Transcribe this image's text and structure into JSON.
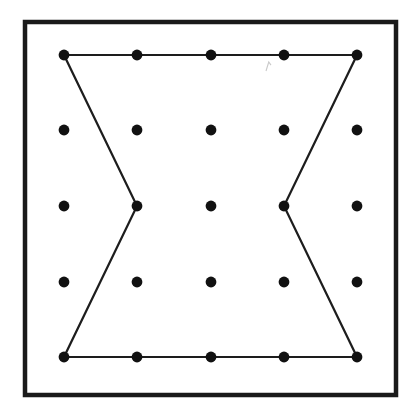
{
  "figure": {
    "canvas": {
      "width": 409,
      "height": 410
    },
    "colors": {
      "background": "#ffffff",
      "ink": "#141414",
      "peg_fill": "#111111",
      "frame_stroke": "#1a1a1a",
      "band_stroke": "#1d1d1d",
      "smudge": "#c9c9c9"
    },
    "frame": {
      "name": "board-frame",
      "x": 25,
      "y": 22,
      "width": 371,
      "height": 373,
      "stroke_width": 4.5
    },
    "grid": {
      "rows": 5,
      "cols": 5,
      "peg_radius": 5.4,
      "col_x": [
        64,
        137,
        211,
        284,
        357
      ],
      "row_y": [
        55,
        130,
        206,
        282,
        357
      ],
      "peg_count": 25
    },
    "band": {
      "name": "hourglass-band",
      "stroke_width": 2.2,
      "closed": true,
      "vertex_count": 6,
      "vertices": [
        {
          "label": "top-left",
          "row": 0,
          "col": 0,
          "x": 64,
          "y": 55
        },
        {
          "label": "top-right",
          "row": 0,
          "col": 4,
          "x": 357,
          "y": 55
        },
        {
          "label": "middle-right-waist",
          "row": 2,
          "col": 3,
          "x": 284,
          "y": 206
        },
        {
          "label": "bottom-right",
          "row": 4,
          "col": 4,
          "x": 357,
          "y": 357
        },
        {
          "label": "bottom-left",
          "row": 4,
          "col": 0,
          "x": 64,
          "y": 357
        },
        {
          "label": "middle-left-waist",
          "row": 2,
          "col": 1,
          "x": 137,
          "y": 206
        }
      ]
    },
    "smudge": {
      "name": "paper-smudge",
      "x": 266,
      "y": 62,
      "width": 5,
      "height": 9
    }
  }
}
